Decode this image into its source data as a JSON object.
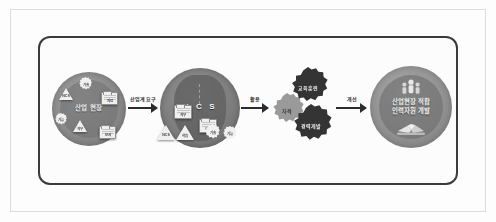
{
  "diagram": {
    "colors": {
      "frame_border": "#3b3b3b",
      "page_border": "#dcdcdc",
      "background": "#fdfdfd",
      "stage1_fill": "#8a8a8a",
      "stage2_fill": "#7c7c7c",
      "gear_dark": "#343434",
      "gear_light": "#9a9a9a",
      "stage4_fill": "#919191",
      "arrow": "#2c2c2c",
      "icon_light": "#f0f0f0"
    },
    "stages": [
      {
        "id": "industrial-site",
        "label": "산업 현장",
        "icons": [
          {
            "name": "triangle-ncs-icon",
            "label": "NCS"
          },
          {
            "name": "gear-tech-icon",
            "label": "기술"
          },
          {
            "name": "gear-skill-icon",
            "label": "기능"
          },
          {
            "name": "triangle-job-icon",
            "label": "직무"
          },
          {
            "name": "folder-data-icon",
            "label": "자료"
          },
          {
            "name": "folder-document-icon",
            "label": "문서"
          }
        ]
      },
      {
        "id": "ncs",
        "label": "N C S",
        "icons": [
          {
            "name": "folder-duty-icon",
            "label": "직무"
          },
          {
            "name": "folder-duty-icon",
            "label": "직무"
          },
          {
            "name": "triangle-ncs-icon",
            "label": "NCS"
          },
          {
            "name": "triangle-learning-icon",
            "label": "학습"
          },
          {
            "name": "gear-tech-icon",
            "label": "기술"
          },
          {
            "name": "gear-skill-icon",
            "label": "기능"
          }
        ]
      },
      {
        "id": "gear-cluster",
        "gears": [
          {
            "name": "gear-qualification",
            "label": "자격",
            "tone": "light"
          },
          {
            "name": "gear-education-training",
            "label": "교육훈련",
            "tone": "dark"
          },
          {
            "name": "gear-career-development",
            "label": "경력개발",
            "tone": "dark"
          }
        ]
      },
      {
        "id": "outcome",
        "label_line1": "산업현장 적합",
        "label_line2": "인력자원 개발",
        "icons": [
          {
            "name": "people-group-icon",
            "label": ""
          },
          {
            "name": "handshake-icon",
            "label": ""
          }
        ]
      }
    ],
    "arrows": [
      {
        "id": "arrow-industry-demand",
        "label": "산업계 요구"
      },
      {
        "id": "arrow-utilize",
        "label": "활용"
      },
      {
        "id": "arrow-improve",
        "label": "개선"
      }
    ]
  }
}
